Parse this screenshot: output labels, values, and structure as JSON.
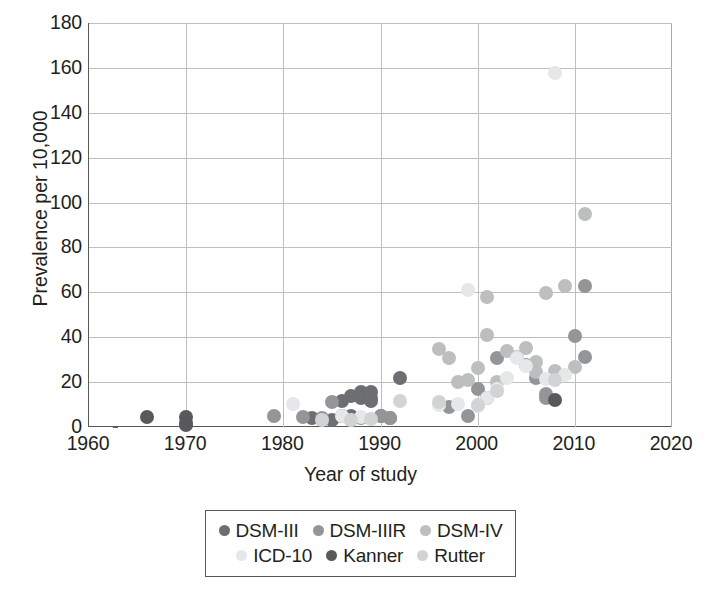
{
  "chart_data": {
    "type": "scatter",
    "title": "",
    "xlabel": "Year of study",
    "ylabel": "Prevalence per 10,000",
    "xlim": [
      1960,
      2020
    ],
    "ylim": [
      0,
      180
    ],
    "xticks": [
      1960,
      1970,
      1980,
      1990,
      2000,
      2010,
      2020
    ],
    "yticks": [
      0,
      20,
      40,
      60,
      80,
      100,
      120,
      140,
      160,
      180
    ],
    "grid": true,
    "legend_position": "below-center",
    "colors": {
      "DSM-III": "#6d6e71",
      "DSM-IIIR": "#939598",
      "DSM-IV": "#bcbec0",
      "ICD-10": "#e6e7e8",
      "Kanner": "#58595b",
      "Rutter": "#d1d3d4"
    },
    "series": [
      {
        "name": "DSM-III",
        "color": "#6d6e71",
        "points": [
          [
            1983,
            4.0
          ],
          [
            1984,
            3.3
          ],
          [
            1985,
            3.3
          ],
          [
            1986,
            4.8
          ],
          [
            1986,
            11.6
          ],
          [
            1987,
            13.6
          ],
          [
            1987,
            5.0
          ],
          [
            1988,
            13.0
          ],
          [
            1988,
            15.5
          ],
          [
            1989,
            15.5
          ],
          [
            1989,
            13.0
          ],
          [
            1990,
            5.0
          ],
          [
            1991,
            4.0
          ],
          [
            1992,
            21.8
          ],
          [
            1989,
            11.7
          ]
        ]
      },
      {
        "name": "DSM-IIIR",
        "color": "#939598",
        "points": [
          [
            1979,
            4.8
          ],
          [
            1982,
            4.6
          ],
          [
            1984,
            4.0
          ],
          [
            1985,
            11.0
          ],
          [
            1987,
            3.0
          ],
          [
            1988,
            4.0
          ],
          [
            1990,
            5.0
          ],
          [
            1991,
            4.2
          ],
          [
            1997,
            8.7
          ],
          [
            1999,
            5.0
          ],
          [
            2000,
            16.8
          ],
          [
            2001,
            12.7
          ],
          [
            2002,
            30.8
          ],
          [
            2005,
            27.5
          ],
          [
            2006,
            22.0
          ],
          [
            2007,
            12.7
          ],
          [
            2007,
            14.5
          ],
          [
            2010,
            40.5
          ],
          [
            2011,
            31.0
          ],
          [
            2011,
            63.0
          ]
        ]
      },
      {
        "name": "DSM-IV",
        "color": "#bcbec0",
        "points": [
          [
            1996,
            34.6
          ],
          [
            1997,
            30.8
          ],
          [
            1998,
            20.0
          ],
          [
            1999,
            21.0
          ],
          [
            2000,
            26.1
          ],
          [
            2001,
            57.9
          ],
          [
            2001,
            41.0
          ],
          [
            2002,
            20.0
          ],
          [
            2003,
            34.0
          ],
          [
            2004,
            31.0
          ],
          [
            2005,
            35.0
          ],
          [
            2006,
            29.0
          ],
          [
            2007,
            59.9
          ],
          [
            2008,
            22.0
          ],
          [
            2009,
            63.0
          ],
          [
            2010,
            26.7
          ],
          [
            2011,
            94.7
          ],
          [
            2006,
            24.5
          ],
          [
            2008,
            25.0
          ]
        ]
      },
      {
        "name": "ICD-10",
        "color": "#e6e7e8",
        "points": [
          [
            1996,
            10.0
          ],
          [
            1998,
            10.2
          ],
          [
            1999,
            61.0
          ],
          [
            2000,
            9.5
          ],
          [
            2001,
            12.7
          ],
          [
            2002,
            16.8
          ],
          [
            2004,
            30.8
          ],
          [
            2005,
            27.0
          ],
          [
            2007,
            21.6
          ],
          [
            2008,
            157.8
          ],
          [
            2009,
            23.0
          ],
          [
            1981,
            10.1
          ],
          [
            1986,
            4.9
          ],
          [
            1988,
            4.6
          ],
          [
            2003,
            22.0
          ]
        ]
      },
      {
        "name": "Kanner",
        "color": "#58595b",
        "points": [
          [
            1966,
            4.5
          ],
          [
            1970,
            4.3
          ],
          [
            1970,
            2.0
          ],
          [
            1970,
            0.7
          ],
          [
            2008,
            12.2
          ]
        ]
      },
      {
        "name": "Rutter",
        "color": "#d1d3d4",
        "points": [
          [
            1984,
            3.0
          ],
          [
            1987,
            3.2
          ],
          [
            1989,
            3.5
          ],
          [
            1992,
            11.6
          ],
          [
            1996,
            11.0
          ],
          [
            2000,
            10.0
          ],
          [
            2002,
            16.0
          ],
          [
            2008,
            21.0
          ]
        ]
      }
    ]
  },
  "axes": {
    "y_title": "Prevalence per 10,000",
    "x_title": "Year of study",
    "y_tick_labels": [
      "180",
      "160",
      "140",
      "120",
      "100",
      "80",
      "60",
      "40",
      "20",
      "0"
    ],
    "x_tick_labels": [
      "1960",
      "1970",
      "1980",
      "1990",
      "2000",
      "2010",
      "2020"
    ]
  },
  "legend": {
    "rows": [
      [
        {
          "label": "DSM-III",
          "color": "#6d6e71"
        },
        {
          "label": "DSM-IIIR",
          "color": "#939598"
        },
        {
          "label": "DSM-IV",
          "color": "#bcbec0"
        }
      ],
      [
        {
          "label": "ICD-10",
          "color": "#e6e7e8"
        },
        {
          "label": "Kanner",
          "color": "#58595b"
        },
        {
          "label": "Rutter",
          "color": "#d1d3d4"
        }
      ]
    ]
  }
}
